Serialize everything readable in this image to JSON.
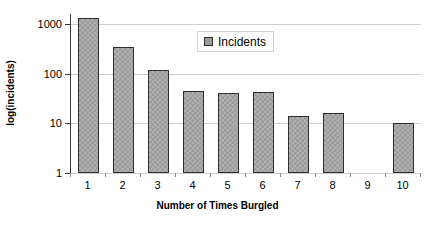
{
  "chart_data": {
    "type": "bar",
    "title": "",
    "xlabel": "Number of Times Burgled",
    "ylabel": "log(incidents)",
    "categories": [
      "1",
      "2",
      "3",
      "4",
      "5",
      "6",
      "7",
      "8",
      "9",
      "10"
    ],
    "values": [
      1300,
      340,
      118,
      45,
      40,
      43,
      14,
      16,
      0,
      10
    ],
    "series": [
      {
        "name": "Incidents",
        "values": [
          1300,
          340,
          118,
          45,
          40,
          43,
          14,
          16,
          0,
          10
        ]
      }
    ],
    "yscale": "log",
    "ylim": [
      1,
      1000
    ],
    "y_ticks": [
      1,
      10,
      100,
      1000
    ],
    "y_tick_labels": [
      "1",
      "10",
      "100",
      "1000"
    ],
    "grid": "horizontal",
    "legend": {
      "position": "top-center-inside",
      "entries": [
        "Incidents"
      ]
    },
    "bar_color": "#9b9b9b",
    "bar_border_color": "#2e2e2e",
    "gridline_color": "#cfcfcf",
    "axis_color": "#3a3a3a"
  }
}
